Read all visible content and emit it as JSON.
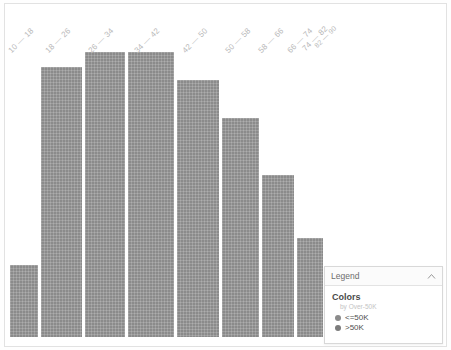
{
  "chart_data": {
    "type": "bar",
    "title": "",
    "subtitle": "",
    "xlabel": "",
    "ylabel": "",
    "grid": false,
    "categories": [
      "10 — 18",
      "18 — 26",
      "26 — 34",
      "34 — 42",
      "42 — 50",
      "50 — 58",
      "58 — 66",
      "66 — 74",
      "74 — 82",
      "82 — 90"
    ],
    "values": [
      72,
      270,
      285,
      285,
      257,
      219,
      162,
      99,
      52,
      32
    ],
    "ylim": [
      0,
      300
    ],
    "series": [
      {
        "name": "<=50K",
        "values": [
          72,
          270,
          285,
          285,
          257,
          219,
          162,
          99,
          52,
          32
        ]
      }
    ],
    "legend_position": "bottom-right",
    "bar_color": "#8b8b8b"
  },
  "axis": {
    "tick_labels": [
      "10 — 18",
      "18 — 26",
      "26 — 34",
      "34 — 42",
      "42 — 50",
      "50 — 58",
      "58 — 66",
      "66 — 74",
      "74 — 82",
      "82 — 90"
    ]
  },
  "legend": {
    "header_title": "Legend",
    "collapse_icon": "chevron-up-icon",
    "section_title": "Colors",
    "section_subtitle": "by Over-50K",
    "items": [
      {
        "label": "<=50K",
        "color": "#8b8b8b",
        "swatch_icon": "circle-swatch-icon"
      },
      {
        "label": ">50K",
        "color": "#7c7c7c",
        "swatch_icon": "circle-swatch-icon"
      }
    ]
  },
  "colors": {
    "bar": "#8b8b8b",
    "tick_label": "#b9b9b9",
    "panel_border": "#d8d8d8",
    "card_border": "#e2e2e2",
    "background": "#ffffff"
  }
}
